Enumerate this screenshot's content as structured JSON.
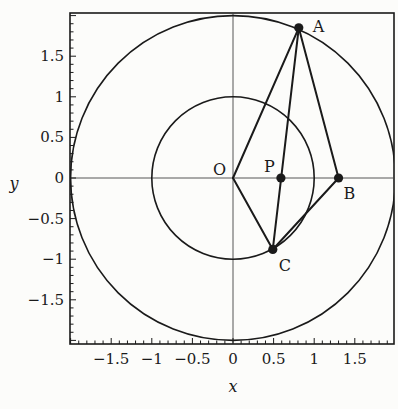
{
  "chart_data": {
    "type": "scatter",
    "title": "",
    "xlabel": "x",
    "ylabel": "y",
    "xlim": [
      -2,
      2
    ],
    "ylim": [
      -2,
      2
    ],
    "xticks": [
      -1.5,
      -1,
      -0.5,
      0,
      0.5,
      1,
      1.5
    ],
    "xtick_labels": [
      "−1.5",
      "−1",
      "−0.5",
      "0",
      "0.5",
      "1",
      "1.5"
    ],
    "yticks": [
      1.5,
      1,
      0.5,
      0,
      -0.5,
      -1,
      -1.5
    ],
    "ytick_labels": [
      "1.5",
      "1",
      "0.5",
      "0",
      "−0.5",
      "−1",
      "−1.5"
    ],
    "minor_tick_step": 0.1,
    "grid": false,
    "axes_lines": true,
    "circles": [
      {
        "name": "outer-circle",
        "center": [
          0,
          0
        ],
        "radius": 2
      },
      {
        "name": "inner-circle",
        "center": [
          0,
          0
        ],
        "radius": 1
      }
    ],
    "points": [
      {
        "label": "O",
        "x": 0,
        "y": 0,
        "marker": false,
        "label_pos": "left-above"
      },
      {
        "label": "A",
        "x": 0.81,
        "y": 1.85,
        "marker": true,
        "label_pos": "right"
      },
      {
        "label": "P",
        "x": 0.59,
        "y": 0,
        "marker": true,
        "label_pos": "left-above"
      },
      {
        "label": "B",
        "x": 1.3,
        "y": 0,
        "marker": true,
        "label_pos": "right-below"
      },
      {
        "label": "C",
        "x": 0.49,
        "y": -0.88,
        "marker": true,
        "label_pos": "right-below"
      }
    ],
    "segments": [
      [
        "O",
        "A"
      ],
      [
        "A",
        "C"
      ],
      [
        "A",
        "B"
      ],
      [
        "B",
        "C"
      ],
      [
        "O",
        "C"
      ]
    ]
  },
  "colors": {
    "ink": "#1a1a1a",
    "background": "#fcfcfa"
  }
}
